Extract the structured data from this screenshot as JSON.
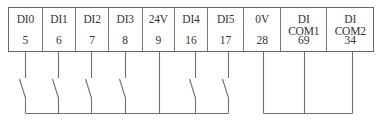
{
  "terminals": [
    {
      "label": "DI0",
      "pin": "5",
      "width": 34,
      "wire_x": 25,
      "switch": true
    },
    {
      "label": "DI1",
      "pin": "6",
      "width": 34,
      "wire_x": 58,
      "switch": true
    },
    {
      "label": "DI2",
      "pin": "7",
      "width": 33,
      "wire_x": 91,
      "switch": true
    },
    {
      "label": "DI3",
      "pin": "8",
      "width": 34,
      "wire_x": 125,
      "switch": true
    },
    {
      "label": "24V",
      "pin": "9",
      "width": 33,
      "wire_x": 159,
      "switch": false
    },
    {
      "label": "DI4",
      "pin": "16",
      "width": 33,
      "wire_x": 195,
      "switch": true
    },
    {
      "label": "DI5",
      "pin": "17",
      "width": 37,
      "wire_x": 228,
      "switch": true
    },
    {
      "label": "0V",
      "pin": "28",
      "width": 37,
      "wire_x": 263,
      "switch": false
    },
    {
      "label": "DI COM1",
      "pin": "69",
      "width": 47,
      "wire_x": 304,
      "switch": false
    },
    {
      "label": "DI COM2",
      "pin": "34",
      "width": 46,
      "wire_x": 352,
      "switch": false
    }
  ],
  "buses": [
    {
      "name": "switch-common-rail",
      "from_x": 25,
      "to_x": 228,
      "y": 113
    },
    {
      "name": "com-rail",
      "from_x": 263,
      "to_x": 352,
      "y": 113
    }
  ],
  "colors": {
    "line": "#6f6f6f",
    "text": "#333333"
  }
}
